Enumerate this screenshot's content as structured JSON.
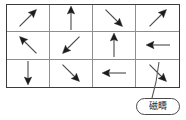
{
  "figure": {
    "type": "magnetic-domain-grid",
    "grid": {
      "columns": 4,
      "rows": 3,
      "cells": [
        {
          "row": 1,
          "col": 1,
          "direction": "northeast",
          "angle_deg": 45,
          "icon": "arrow-northeast-icon"
        },
        {
          "row": 1,
          "col": 2,
          "direction": "north",
          "angle_deg": 90,
          "icon": "arrow-north-icon"
        },
        {
          "row": 1,
          "col": 3,
          "direction": "southeast",
          "angle_deg": -45,
          "icon": "arrow-southeast-icon"
        },
        {
          "row": 1,
          "col": 4,
          "direction": "northeast",
          "angle_deg": 45,
          "icon": "arrow-northeast-icon"
        },
        {
          "row": 2,
          "col": 1,
          "direction": "northwest",
          "angle_deg": 135,
          "icon": "arrow-northwest-icon"
        },
        {
          "row": 2,
          "col": 2,
          "direction": "southwest",
          "angle_deg": 225,
          "icon": "arrow-southwest-icon"
        },
        {
          "row": 2,
          "col": 3,
          "direction": "north",
          "angle_deg": 90,
          "icon": "arrow-north-icon"
        },
        {
          "row": 2,
          "col": 4,
          "direction": "west",
          "angle_deg": 180,
          "icon": "arrow-west-icon"
        },
        {
          "row": 3,
          "col": 1,
          "direction": "south",
          "angle_deg": -90,
          "icon": "arrow-south-icon"
        },
        {
          "row": 3,
          "col": 2,
          "direction": "southeast",
          "angle_deg": -45,
          "icon": "arrow-southeast-icon"
        },
        {
          "row": 3,
          "col": 3,
          "direction": "west",
          "angle_deg": 180,
          "icon": "arrow-west-icon"
        },
        {
          "row": 3,
          "col": 4,
          "direction": "southeast",
          "angle_deg": -45,
          "icon": "arrow-southeast-icon"
        }
      ]
    },
    "callout": {
      "label": "磁疇",
      "points_to_cell": {
        "row": 3,
        "col": 4
      }
    },
    "colors": {
      "outer_border": "#3b3b3b",
      "inner_grid_line": "#8e8e8e",
      "arrow": "#1c1c1c",
      "arrow_shaft": "#4a4a4a",
      "callout_border": "#4a4a4a",
      "background": "#ffffff",
      "text": "#1a1a1a"
    }
  }
}
